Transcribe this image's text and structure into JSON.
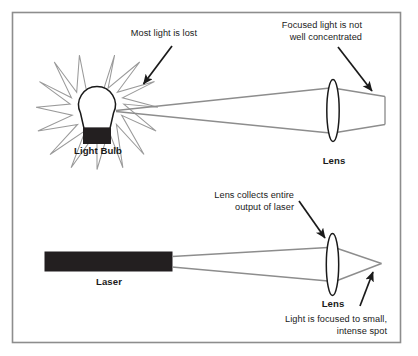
{
  "figure": {
    "border_color": "#808080",
    "ray_color": "#8a8a8a",
    "ink_color": "#1a1a1a",
    "fill_black": "#231f20"
  },
  "top_panel": {
    "source_label": "Light Bulb",
    "lens_label": "Lens",
    "annotation_loss": "Most light is lost",
    "annotation_focus_line1": "Focused light is not",
    "annotation_focus_line2": "well concentrated"
  },
  "bottom_panel": {
    "source_label": "Laser",
    "lens_label": "Lens",
    "annotation_collect_line1": "Lens collects entire",
    "annotation_collect_line2": "output of laser",
    "annotation_spot_line1": "Light is focused to small,",
    "annotation_spot_line2": "intense spot"
  },
  "icons": {
    "starburst": "starburst-rays-icon",
    "bulb": "light-bulb-icon",
    "laser": "laser-bar-icon",
    "lens": "lens-ellipse-icon",
    "arrow": "pointer-arrow-icon"
  }
}
